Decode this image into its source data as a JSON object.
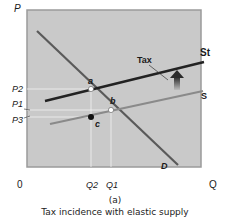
{
  "axes": {
    "y_label": "P",
    "x_label": "Q",
    "origin": "0",
    "price_ticks": [
      "P2",
      "P1",
      "P3"
    ],
    "quantity_ticks": [
      "Q2",
      "Q1"
    ]
  },
  "curves": {
    "demand": "D",
    "supply": "S",
    "supply_with_tax": "St",
    "tax": "Tax"
  },
  "points": {
    "a": "a",
    "b": "b",
    "c": "c"
  },
  "caption": {
    "panel": "(a)",
    "title": "Tax incidence with elastic supply"
  },
  "colors": {
    "plot_bg": "#c9c9c9",
    "demand": "#5a5a5a",
    "supply": "#8a8a8a",
    "supply_tax": "#222222",
    "guide": "#f2f2f2"
  }
}
